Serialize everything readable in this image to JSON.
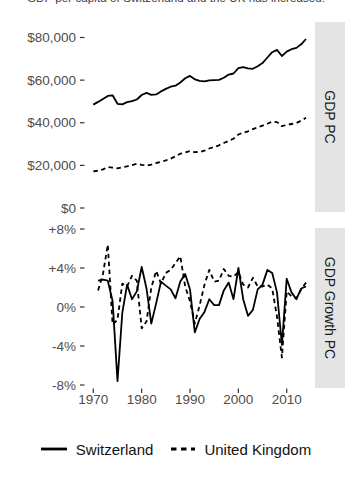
{
  "page": {
    "title_clipped": "GDP per capita of Switzerland and the UK has increased."
  },
  "colors": {
    "line": "#000000",
    "strip_bg": "#e4e4e4",
    "strip_text": "#1a1a1a",
    "axis_text": "#4d4d4d",
    "tick": "#333333",
    "panel_bg": "#ffffff"
  },
  "x_axis": {
    "ticks": [
      1970,
      1980,
      1990,
      2000,
      2010
    ]
  },
  "legend": {
    "items": [
      {
        "label": "Switzerland",
        "style": "solid"
      },
      {
        "label": "United Kingdom",
        "style": "dashed"
      }
    ]
  },
  "chart_data": [
    {
      "type": "line",
      "facet_label": "GDP PC",
      "ylabel": "GDP per capita (USD)",
      "ylim": [
        0,
        85000
      ],
      "yticks": [
        80000,
        60000,
        40000,
        20000,
        0
      ],
      "ytick_labels": [
        "$80,000",
        "$60,000",
        "$40,000",
        "$20,000",
        "$0"
      ],
      "grid": "off",
      "legend_position": "bottom",
      "x": [
        1970,
        1971,
        1972,
        1973,
        1974,
        1975,
        1976,
        1977,
        1978,
        1979,
        1980,
        1981,
        1982,
        1983,
        1984,
        1985,
        1986,
        1987,
        1988,
        1989,
        1990,
        1991,
        1992,
        1993,
        1994,
        1995,
        1996,
        1997,
        1998,
        1999,
        2000,
        2001,
        2002,
        2003,
        2004,
        2005,
        2006,
        2007,
        2008,
        2009,
        2010,
        2011,
        2012,
        2013,
        2014
      ],
      "series": [
        {
          "name": "Switzerland",
          "style": "solid",
          "values": [
            48500,
            49800,
            51200,
            52600,
            52900,
            48900,
            48600,
            49700,
            50100,
            50900,
            53000,
            54000,
            53100,
            53300,
            54700,
            55900,
            56900,
            57400,
            58900,
            60900,
            62000,
            60400,
            59700,
            59400,
            59900,
            60000,
            60100,
            61100,
            62600,
            63100,
            65600,
            66100,
            65500,
            65300,
            66500,
            68000,
            70600,
            73100,
            74200,
            71300,
            73400,
            74500,
            75100,
            76800,
            79300
          ]
        },
        {
          "name": "United Kingdom",
          "style": "dashed",
          "values": [
            17200,
            17500,
            18100,
            19250,
            18900,
            18650,
            19100,
            19500,
            20150,
            20700,
            20250,
            19950,
            20350,
            21100,
            21600,
            22350,
            23200,
            24250,
            25500,
            26050,
            26700,
            26250,
            26300,
            26900,
            27900,
            28600,
            29400,
            30500,
            31500,
            32500,
            34500,
            35300,
            36000,
            37000,
            37800,
            38600,
            39500,
            40600,
            40300,
            38400,
            39000,
            39400,
            39900,
            41000,
            42300
          ]
        }
      ]
    },
    {
      "type": "line",
      "facet_label": "GDP Growth PC",
      "ylabel": "Annual GDP per capita growth (%)",
      "ylim": [
        -8.5,
        8.5
      ],
      "yticks": [
        8,
        4,
        0,
        -4,
        -8
      ],
      "ytick_labels": [
        "+8%",
        "+4%",
        "0%",
        "-4%",
        "-8%"
      ],
      "grid": "off",
      "legend_position": "bottom",
      "x": [
        1971,
        1972,
        1973,
        1974,
        1975,
        1976,
        1977,
        1978,
        1979,
        1980,
        1981,
        1982,
        1983,
        1984,
        1985,
        1986,
        1987,
        1988,
        1989,
        1990,
        1991,
        1992,
        1993,
        1994,
        1995,
        1996,
        1997,
        1998,
        1999,
        2000,
        2001,
        2002,
        2003,
        2004,
        2005,
        2006,
        2007,
        2008,
        2009,
        2010,
        2011,
        2012,
        2013,
        2014
      ],
      "series": [
        {
          "name": "Switzerland",
          "style": "solid",
          "values": [
            2.7,
            2.8,
            2.7,
            0.6,
            -7.6,
            -0.6,
            2.3,
            0.8,
            1.6,
            4.1,
            1.9,
            -1.7,
            0.4,
            2.6,
            2.2,
            1.8,
            0.9,
            2.6,
            3.4,
            1.8,
            -2.6,
            -1.2,
            -0.5,
            0.8,
            0.2,
            0.2,
            1.7,
            2.5,
            0.8,
            4.0,
            0.8,
            -0.9,
            -0.3,
            1.8,
            2.3,
            3.8,
            3.5,
            1.5,
            -3.9,
            2.9,
            1.5,
            0.8,
            1.9,
            2.1
          ]
        },
        {
          "name": "United Kingdom",
          "style": "dashed",
          "values": [
            1.7,
            3.4,
            6.4,
            -1.8,
            -1.3,
            2.4,
            2.1,
            3.2,
            2.7,
            -2.2,
            -1.5,
            2.0,
            3.7,
            2.4,
            3.5,
            3.8,
            4.5,
            5.2,
            2.1,
            0.6,
            -1.7,
            0.2,
            2.3,
            3.8,
            2.6,
            2.7,
            3.9,
            3.2,
            3.1,
            3.6,
            2.3,
            2.0,
            3.0,
            2.1,
            2.1,
            2.3,
            1.9,
            -1.0,
            -5.2,
            1.6,
            1.1,
            0.9,
            1.8,
            2.5
          ]
        }
      ]
    }
  ]
}
